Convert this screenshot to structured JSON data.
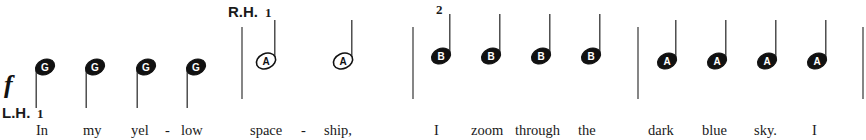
{
  "dynamic": "f",
  "hands": {
    "left": {
      "label": "L.H.",
      "finger": "1"
    },
    "right": {
      "label": "R.H.",
      "finger": "1"
    }
  },
  "measures": [
    {
      "hand": "left",
      "notes": [
        {
          "name": "G",
          "duration": "quarter",
          "lyric": "In"
        },
        {
          "name": "G",
          "duration": "quarter",
          "lyric": "my"
        },
        {
          "name": "G",
          "duration": "quarter",
          "lyric": "yel"
        },
        {
          "name": "G",
          "duration": "quarter",
          "lyric": "low"
        }
      ],
      "hyphens": [
        "-"
      ]
    },
    {
      "hand": "right",
      "notes": [
        {
          "name": "A",
          "duration": "half",
          "lyric": "space"
        },
        {
          "name": "A",
          "duration": "half",
          "lyric": "ship,"
        }
      ],
      "hyphens": [
        "-"
      ]
    },
    {
      "hand": "right",
      "finger": "2",
      "notes": [
        {
          "name": "B",
          "duration": "quarter",
          "lyric": "I"
        },
        {
          "name": "B",
          "duration": "quarter",
          "lyric": "zoom"
        },
        {
          "name": "B",
          "duration": "quarter",
          "lyric": "through"
        },
        {
          "name": "B",
          "duration": "quarter",
          "lyric": "the"
        }
      ]
    },
    {
      "hand": "right",
      "notes": [
        {
          "name": "A",
          "duration": "quarter",
          "lyric": "dark"
        },
        {
          "name": "A",
          "duration": "quarter",
          "lyric": "blue"
        },
        {
          "name": "A",
          "duration": "quarter",
          "lyric": "sky."
        },
        {
          "name": "A",
          "duration": "quarter",
          "lyric": "I"
        }
      ]
    }
  ],
  "colors": {
    "ink": "#111111",
    "paper": "#ffffff",
    "barline": "#555555"
  }
}
